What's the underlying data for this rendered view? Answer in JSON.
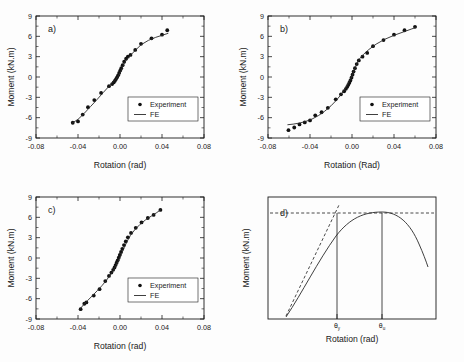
{
  "figure": {
    "panels": [
      "a)",
      "b)",
      "c)",
      "d)"
    ]
  },
  "legend": {
    "experiment": "Experiment",
    "fe": "FE"
  },
  "colors": {
    "line": "#2a2a2a",
    "marker": "#111111",
    "axis": "#1a1a1a",
    "background": "#fdfdfd"
  },
  "chart_data": [
    {
      "type": "scatter",
      "title": "a)",
      "xlabel": "Rotation (rad)",
      "ylabel": "Moment (kN.m)",
      "xlim": [
        -0.08,
        0.08
      ],
      "ylim": [
        -9,
        9
      ],
      "xticks": [
        -0.08,
        -0.04,
        0.0,
        0.04,
        0.08
      ],
      "xticklabels": [
        "-0.08",
        "-0.04",
        "0.00",
        "0.04",
        "0.08"
      ],
      "yticks": [
        -9,
        -6,
        -3,
        0,
        3,
        6,
        9
      ],
      "yticklabels": [
        "-9",
        "-6",
        "-3",
        "0",
        "3",
        "6",
        "9"
      ],
      "grid": false,
      "legend": [
        "Experiment",
        "FE"
      ],
      "legend_position": "lower right",
      "series": [
        {
          "name": "Experiment",
          "type": "scatter",
          "x": [
            -0.045,
            -0.04,
            -0.0355,
            -0.0305,
            -0.0245,
            -0.018,
            -0.0105,
            -0.0075,
            -0.006,
            -0.0048,
            -0.0038,
            -0.0028,
            -0.0018,
            -0.0008,
            0.0002,
            0.0012,
            0.0025,
            0.004,
            0.0058,
            0.0075,
            0.01,
            0.0145,
            0.02,
            0.03,
            0.04,
            0.045
          ],
          "y": [
            -6.75,
            -6.55,
            -5.55,
            -4.45,
            -3.4,
            -2.35,
            -1.35,
            -1.05,
            -0.8,
            -0.55,
            -0.3,
            -0.05,
            0.25,
            0.6,
            0.95,
            1.3,
            1.75,
            2.25,
            2.7,
            3.0,
            3.25,
            4.0,
            4.9,
            5.7,
            6.25,
            6.9
          ]
        },
        {
          "name": "FE",
          "type": "line",
          "x": [
            -0.046,
            -0.04,
            -0.034,
            -0.028,
            -0.022,
            -0.016,
            -0.011,
            -0.007,
            -0.004,
            -0.002,
            0.0,
            0.002,
            0.004,
            0.007,
            0.01,
            0.014,
            0.02,
            0.027,
            0.034,
            0.041,
            0.046
          ],
          "y": [
            -6.85,
            -6.25,
            -5.35,
            -4.35,
            -3.35,
            -2.3,
            -1.45,
            -0.85,
            -0.35,
            0.05,
            0.6,
            1.25,
            2.0,
            2.7,
            3.2,
            3.85,
            4.75,
            5.4,
            5.85,
            6.2,
            6.45
          ]
        }
      ]
    },
    {
      "type": "scatter",
      "title": "b)",
      "xlabel": "Rotation (Rad)",
      "ylabel": "Moment (kN.m)",
      "xlim": [
        -0.08,
        0.08
      ],
      "ylim": [
        -9,
        9
      ],
      "xticks": [
        -0.08,
        -0.04,
        0.0,
        0.04,
        0.08
      ],
      "xticklabels": [
        "-0.08",
        "-0.04",
        "0.00",
        "0.04",
        "0.08"
      ],
      "yticks": [
        -9,
        -6,
        -3,
        0,
        3,
        6,
        9
      ],
      "yticklabels": [
        "-9",
        "-6",
        "-3",
        "0",
        "3",
        "6",
        "9"
      ],
      "grid": false,
      "legend": [
        "Experiment",
        "FE"
      ],
      "legend_position": "lower right",
      "series": [
        {
          "name": "Experiment",
          "type": "scatter",
          "x": [
            -0.0605,
            -0.055,
            -0.05,
            -0.045,
            -0.04,
            -0.035,
            -0.029,
            -0.023,
            -0.0155,
            -0.0105,
            -0.0075,
            -0.0058,
            -0.0045,
            -0.0035,
            -0.0025,
            -0.0015,
            -0.0005,
            0.0005,
            0.0015,
            0.0028,
            0.0045,
            0.0065,
            0.01,
            0.0145,
            0.02,
            0.03,
            0.04,
            0.05,
            0.06
          ],
          "y": [
            -7.85,
            -7.45,
            -7.0,
            -6.7,
            -6.4,
            -5.65,
            -5.2,
            -4.55,
            -3.3,
            -2.55,
            -2.1,
            -1.75,
            -1.45,
            -1.15,
            -0.85,
            -0.5,
            -0.1,
            0.35,
            0.8,
            1.3,
            1.9,
            2.45,
            3.0,
            3.55,
            4.55,
            5.45,
            6.25,
            6.9,
            7.4
          ]
        },
        {
          "name": "FE",
          "type": "line",
          "x": [
            -0.0615,
            -0.056,
            -0.05,
            -0.044,
            -0.038,
            -0.032,
            -0.026,
            -0.02,
            -0.015,
            -0.011,
            -0.0075,
            -0.0045,
            -0.002,
            0.0,
            0.002,
            0.0045,
            0.0075,
            0.011,
            0.016,
            0.023,
            0.031,
            0.04,
            0.049,
            0.057,
            0.0615
          ],
          "y": [
            -7.05,
            -6.95,
            -6.8,
            -6.55,
            -6.2,
            -5.7,
            -5.05,
            -4.25,
            -3.45,
            -2.7,
            -1.95,
            -1.2,
            -0.45,
            0.15,
            0.95,
            1.9,
            2.75,
            3.35,
            4.05,
            4.85,
            5.55,
            6.15,
            6.65,
            7.1,
            7.35
          ]
        }
      ]
    },
    {
      "type": "scatter",
      "title": "c)",
      "xlabel": "Rotation (rad)",
      "ylabel": "Moment (kN.m)",
      "xlim": [
        -0.08,
        0.08
      ],
      "ylim": [
        -9,
        9
      ],
      "xticks": [
        -0.08,
        -0.04,
        0.0,
        0.04,
        0.08
      ],
      "xticklabels": [
        "-0.08",
        "-0.04",
        "0.00",
        "0.04",
        "0.08"
      ],
      "yticks": [
        -9,
        -6,
        -3,
        0,
        3,
        6,
        9
      ],
      "yticklabels": [
        "-9",
        "-6",
        "-3",
        "0",
        "3",
        "6",
        "9"
      ],
      "grid": false,
      "legend": [
        "Experiment",
        "FE"
      ],
      "legend_position": "lower right",
      "series": [
        {
          "name": "Experiment",
          "type": "scatter",
          "x": [
            -0.0375,
            -0.034,
            -0.032,
            -0.025,
            -0.0195,
            -0.014,
            -0.0105,
            -0.0082,
            -0.0065,
            -0.0052,
            -0.0042,
            -0.0032,
            -0.0022,
            -0.0012,
            -0.0002,
            0.001,
            0.0022,
            0.0038,
            0.0055,
            0.0075,
            0.0105,
            0.015,
            0.0205,
            0.0265,
            0.032,
            0.0385
          ],
          "y": [
            -7.55,
            -6.75,
            -6.55,
            -5.55,
            -4.6,
            -3.4,
            -2.65,
            -2.15,
            -1.75,
            -1.4,
            -1.05,
            -0.7,
            -0.35,
            0.05,
            0.45,
            0.9,
            1.35,
            1.9,
            2.45,
            3.05,
            3.7,
            4.45,
            5.25,
            5.9,
            6.35,
            7.1
          ]
        },
        {
          "name": "FE",
          "type": "line",
          "x": [
            -0.0385,
            -0.035,
            -0.031,
            -0.0265,
            -0.0215,
            -0.017,
            -0.013,
            -0.0095,
            -0.0065,
            -0.004,
            -0.0018,
            0.0,
            0.002,
            0.0042,
            0.0068,
            0.01,
            0.014,
            0.019,
            0.0245,
            0.03,
            0.035,
            0.039
          ],
          "y": [
            -7.6,
            -6.95,
            -6.3,
            -5.6,
            -4.8,
            -4.05,
            -3.3,
            -2.55,
            -1.85,
            -1.15,
            -0.5,
            0.1,
            0.8,
            1.6,
            2.45,
            3.35,
            4.15,
            4.95,
            5.65,
            6.2,
            6.7,
            7.15
          ]
        }
      ]
    },
    {
      "type": "line",
      "title": "d)",
      "xlabel": "Rotation (rad)",
      "ylabel": "Moment (kN.m)",
      "grid": false,
      "schematic": true,
      "annotations": [
        {
          "name": "theta-yield",
          "label": "θ",
          "subscript": "y"
        },
        {
          "name": "theta-ultimate",
          "label": "θ",
          "subscript": "u"
        }
      ],
      "elements": [
        "moment-rotation-curve",
        "initial-stiffness-tangent-dashed",
        "peak-moment-horizontal-dashed",
        "theta-y-vertical-line",
        "theta-u-vertical-line"
      ]
    }
  ]
}
